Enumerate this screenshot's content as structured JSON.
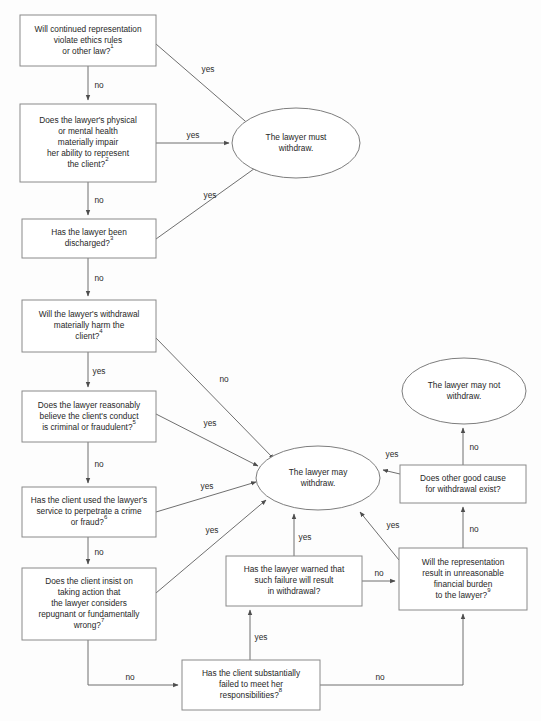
{
  "diagram": {
    "title_clipped": "",
    "colors": {
      "background": "#fdfdfd",
      "box_fill": "#ffffff",
      "box_stroke": "#8a8a8a",
      "ellipse_stroke": "#7d7d7d",
      "edge_stroke": "#6f6f6f",
      "text": "#272727"
    },
    "nodes": [
      {
        "id": "n1",
        "shape": "box",
        "x": 20,
        "y": 15,
        "w": 136,
        "h": 51,
        "lines": [
          "Will continued representation",
          "violate ethics rules",
          "or other law?"
        ],
        "superscript": "1"
      },
      {
        "id": "n2",
        "shape": "box",
        "x": 20,
        "y": 104,
        "w": 136,
        "h": 78,
        "lines": [
          "Does the lawyer's physical",
          "or mental health",
          "materially impair",
          "her ability to represent",
          "the client?"
        ],
        "superscript": "2"
      },
      {
        "id": "n3",
        "shape": "box",
        "x": 22,
        "y": 219,
        "w": 134,
        "h": 39,
        "lines": [
          "Has the lawyer been",
          "discharged?"
        ],
        "superscript": "3"
      },
      {
        "id": "n4",
        "shape": "box",
        "x": 22,
        "y": 300,
        "w": 134,
        "h": 52,
        "lines": [
          "Will the lawyer's withdrawal",
          "materially harm the",
          "client?"
        ],
        "superscript": "4"
      },
      {
        "id": "n5",
        "shape": "box",
        "x": 22,
        "y": 391,
        "w": 134,
        "h": 51,
        "lines": [
          "Does the lawyer reasonably",
          "believe the client's conduct",
          "is criminal or fraudulent?"
        ],
        "superscript": "5"
      },
      {
        "id": "n6",
        "shape": "box",
        "x": 22,
        "y": 487,
        "w": 134,
        "h": 50,
        "lines": [
          "Has the client used the lawyer's",
          "service to perpetrate a crime",
          "or fraud?"
        ],
        "superscript": "6"
      },
      {
        "id": "n7",
        "shape": "box",
        "x": 22,
        "y": 568,
        "w": 134,
        "h": 72,
        "lines": [
          "Does the client insist on",
          "taking action that",
          "the lawyer considers",
          "repugnant or fundamentally",
          "wrong?"
        ],
        "superscript": "7"
      },
      {
        "id": "n8",
        "shape": "box",
        "x": 182,
        "y": 660,
        "w": 138,
        "h": 50,
        "lines": [
          "Has the client substantially",
          "failed to meet her",
          "responsibilities?"
        ],
        "superscript": "8"
      },
      {
        "id": "n9",
        "shape": "box",
        "x": 226,
        "y": 556,
        "w": 136,
        "h": 50,
        "lines": [
          "Has the lawyer warned that",
          "such failure will result",
          "in withdrawal?"
        ],
        "superscript": ""
      },
      {
        "id": "n10",
        "shape": "box",
        "x": 399,
        "y": 548,
        "w": 128,
        "h": 62,
        "lines": [
          "Will the representation",
          "result in unreasonable",
          "financial burden",
          "to the lawyer?"
        ],
        "superscript": "9"
      },
      {
        "id": "n11",
        "shape": "box",
        "x": 400,
        "y": 465,
        "w": 126,
        "h": 38,
        "lines": [
          "Does other good cause",
          "for withdrawal exist?"
        ],
        "superscript": ""
      },
      {
        "id": "e1",
        "shape": "ellipse",
        "cx": 296,
        "cy": 143,
        "rx": 64,
        "ry": 35,
        "lines": [
          "The lawyer must",
          "withdraw."
        ],
        "superscript": ""
      },
      {
        "id": "e2",
        "shape": "ellipse",
        "cx": 318,
        "cy": 478,
        "rx": 62,
        "ry": 32,
        "lines": [
          "The lawyer may",
          "withdraw."
        ],
        "superscript": ""
      },
      {
        "id": "e3",
        "shape": "ellipse",
        "cx": 464,
        "cy": 391,
        "rx": 62,
        "ry": 33,
        "lines": [
          "The lawyer may not",
          "withdraw."
        ],
        "superscript": ""
      }
    ],
    "edge_labels": {
      "n1_no": "no",
      "n1_yes": "yes",
      "n2_no": "no",
      "n2_yes": "yes",
      "n3_no": "no",
      "n3_yes": "yes",
      "n4_yes": "yes",
      "n4_no": "no",
      "n5_no": "no",
      "n5_yes": "yes",
      "n6_no": "no",
      "n6_yes": "yes",
      "n7_yes": "yes",
      "n7_no": "no",
      "n8_yes": "yes",
      "n8_no": "no",
      "n9_yes": "yes",
      "n9_no": "no",
      "n10_yes": "yes",
      "n10_no": "no",
      "n11_yes": "yes",
      "n11_no": "no"
    }
  }
}
